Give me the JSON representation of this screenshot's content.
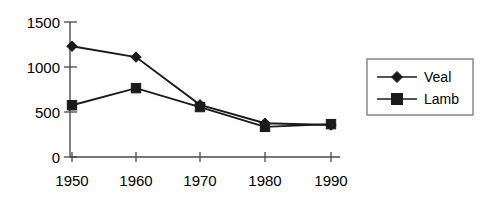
{
  "chart_data": {
    "type": "line",
    "title": "",
    "subtitle": "",
    "xlabel": "",
    "ylabel": "",
    "categories": [
      "1950",
      "1960",
      "1970",
      "1980",
      "1990"
    ],
    "x_tick_labels": [
      "1950",
      "1960",
      "1970",
      "1980",
      "1990"
    ],
    "y_tick_labels": [
      "0",
      "500",
      "1000",
      "1500"
    ],
    "y_ticks": [
      0,
      500,
      1000,
      1500
    ],
    "ylim": [
      0,
      1500
    ],
    "grid": false,
    "legend_position": "right",
    "series": [
      {
        "name": "Veal",
        "marker": "diamond",
        "color": "#1a1a1a",
        "values": [
          1230,
          1110,
          580,
          375,
          355
        ]
      },
      {
        "name": "Lamb",
        "marker": "square",
        "color": "#1a1a1a",
        "values": [
          575,
          765,
          555,
          335,
          365
        ]
      }
    ],
    "annotations": []
  },
  "legend": {
    "entries": [
      {
        "label": "Veal",
        "marker": "diamond"
      },
      {
        "label": "Lamb",
        "marker": "square"
      }
    ]
  },
  "axes": {
    "y_labels": [
      "1500",
      "1000",
      "500",
      "0"
    ],
    "x_labels": [
      "1950",
      "1960",
      "1970",
      "1980",
      "1990"
    ]
  }
}
